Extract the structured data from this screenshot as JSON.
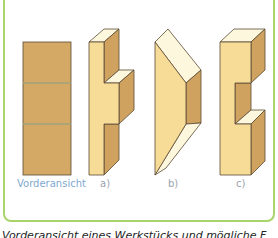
{
  "figure": {
    "frame_color": "#a9d46a",
    "front_view": {
      "label": "Vorderansicht",
      "fill": "#d4a865",
      "divider_color": "#9fa37a"
    },
    "options": [
      {
        "id": "a",
        "label": "a)"
      },
      {
        "id": "b",
        "label": "b)"
      },
      {
        "id": "c",
        "label": "c)"
      }
    ],
    "colors": {
      "face_front": "#f7dc98",
      "face_top": "#fdf7dd",
      "face_side": "#cfa260",
      "outline": "#5a4a35",
      "label_front": "#7fa9cf",
      "label_option": "#9aa3ad"
    }
  },
  "caption": {
    "text": "Vorderansicht eines Werkstücks und mögliche F"
  }
}
